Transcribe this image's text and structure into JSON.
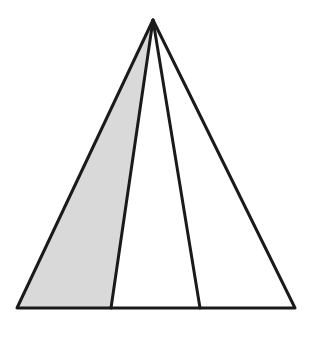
{
  "diagram": {
    "type": "geometry",
    "colors": {
      "stroke": "#1a1a1a",
      "shade": "#d9d9d9",
      "background": "#ffffff"
    },
    "points": {
      "apex": [
        153,
        20
      ],
      "base_left": [
        17,
        308
      ],
      "base_p1": [
        111,
        308
      ],
      "base_p2": [
        200,
        308
      ],
      "base_right": [
        295,
        308
      ]
    },
    "shaded_region": "apex-base_left-base_p1",
    "labels": []
  }
}
